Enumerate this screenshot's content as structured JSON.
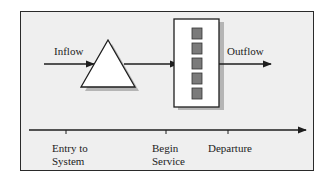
{
  "diagram": {
    "labels": {
      "inflow": "Inflow",
      "outflow": "Outflow"
    },
    "timeline": {
      "ticks": [
        {
          "line1": "Entry to",
          "line2": "System"
        },
        {
          "line1": "Begin",
          "line2": "Service"
        },
        {
          "line1": "Departure",
          "line2": ""
        }
      ]
    },
    "nodes": {
      "queue": "triangle-queue-icon",
      "server": "server-box",
      "server_slots": 5
    },
    "colors": {
      "background": "#efefef",
      "stroke": "#2a2a2a",
      "slot_fill": "#7a7a7a",
      "shadow": "#b5b5b5"
    }
  }
}
